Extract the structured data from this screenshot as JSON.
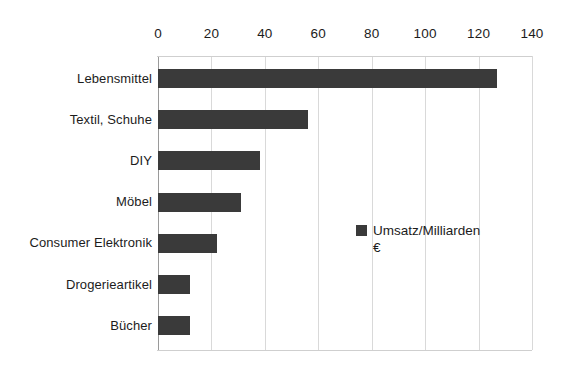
{
  "chart_data": {
    "type": "bar",
    "orientation": "horizontal",
    "title": "",
    "subtitle": "",
    "xlabel": "",
    "ylabel": "",
    "xlim": [
      0,
      140
    ],
    "xticks": [
      0,
      20,
      40,
      60,
      80,
      100,
      120,
      140
    ],
    "xtick_labels": [
      "0",
      "20",
      "40",
      "60",
      "80",
      "100",
      "120",
      "140"
    ],
    "grid": true,
    "grid_axis": "x",
    "legend_position": "center-right",
    "legend": [
      "Umsatz/Milliarden €"
    ],
    "series": [
      {
        "name": "Umsatz/Milliarden €",
        "color": "#3a3a3a",
        "values": [
          127,
          56,
          38,
          31,
          22,
          12,
          12
        ]
      }
    ],
    "categories": [
      "Lebensmittel",
      "Textil, Schuhe",
      "DIY",
      "Möbel",
      "Consumer Elektronik",
      "Drogerieartikel",
      "Bücher"
    ],
    "annotations": []
  },
  "legend": {
    "label": "Umsatz/Milliarden €",
    "swatch_name": "legend-color-swatch",
    "color": "#3a3a3a"
  },
  "axis": {
    "x_ticks": [
      "0",
      "20",
      "40",
      "60",
      "80",
      "100",
      "120",
      "140"
    ]
  },
  "categories": [
    "Lebensmittel",
    "Textil, Schuhe",
    "DIY",
    "Möbel",
    "Consumer Elektronik",
    "Drogerieartikel",
    "Bücher"
  ],
  "colors": {
    "bar": "#3a3a3a",
    "gridline": "#d9d9d9",
    "axis": "#9a9a9a",
    "text": "#1c1c1c",
    "background": "#ffffff"
  }
}
